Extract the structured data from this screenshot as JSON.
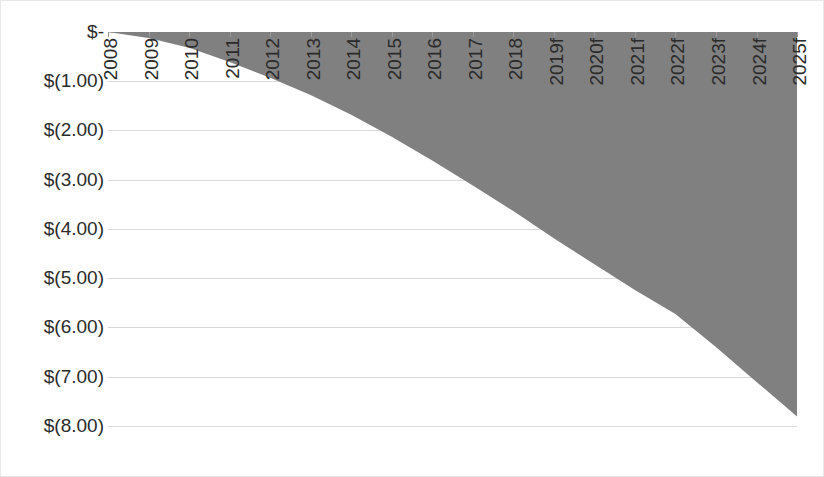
{
  "chart_data": {
    "type": "area",
    "title": "",
    "subtitle": "",
    "xlabel": "",
    "ylabel": "",
    "categories": [
      "2008",
      "2009",
      "2010",
      "2011",
      "2012",
      "2013",
      "2014",
      "2015",
      "2016",
      "2017",
      "2018",
      "2019f",
      "2020f",
      "2021f",
      "2022f",
      "2023f",
      "2024f",
      "2025f"
    ],
    "series": [
      {
        "name": "",
        "values": [
          0.0,
          -0.12,
          -0.32,
          -0.61,
          -0.93,
          -1.28,
          -1.68,
          -2.13,
          -2.61,
          -3.12,
          -3.64,
          -4.19,
          -4.72,
          -5.24,
          -5.73,
          -6.4,
          -7.11,
          -7.81
        ]
      }
    ],
    "ytick_values": [
      0,
      -1,
      -2,
      -3,
      -4,
      -5,
      -6,
      -7,
      -8
    ],
    "ytick_labels": [
      "$-",
      "$(1.00)",
      "$(2.00)",
      "$(3.00)",
      "$(4.00)",
      "$(5.00)",
      "$(6.00)",
      "$(7.00)",
      "$(8.00)"
    ],
    "ylim": [
      -8.9,
      0
    ],
    "grid": true,
    "grid_axis": "y",
    "legend": "none",
    "colors": {
      "series_fill": "#808080",
      "gridline": "#d9d9d9",
      "text": "#2b2b2b",
      "background": "#ffffff",
      "border": "#e8e8e8"
    }
  }
}
